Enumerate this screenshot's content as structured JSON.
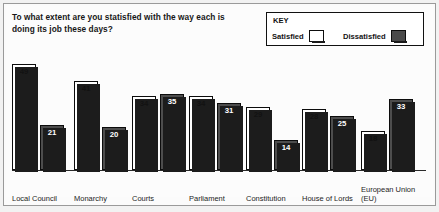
{
  "title": "To what extent are you statisfied with the way each is doing its job these days?",
  "legend": {
    "heading": "KEY",
    "entries": [
      {
        "label": "Satisfied",
        "swatch": "white-square-icon",
        "color": "#ffffff"
      },
      {
        "label": "Dissatisfied",
        "swatch": "dark-square-icon",
        "color": "#4d4d4d"
      }
    ]
  },
  "chart_data": {
    "type": "bar",
    "title": "To what extent are you statisfied with the way each is doing its job these days?",
    "xlabel": "",
    "ylabel": "",
    "ylim": [
      0,
      55
    ],
    "grid": false,
    "legend_position": "top-right",
    "categories": [
      "Local Council",
      "Monarchy",
      "Courts",
      "Parliament",
      "Constitution",
      "House of Lords",
      "European Union (EU)"
    ],
    "series": [
      {
        "name": "Satisfied",
        "color": "#ffffff",
        "values": [
          49,
          41,
          34,
          34,
          29,
          28,
          18
        ]
      },
      {
        "name": "Dissatisfied",
        "color": "#4d4d4d",
        "values": [
          21,
          20,
          35,
          31,
          14,
          25,
          33
        ]
      }
    ]
  }
}
